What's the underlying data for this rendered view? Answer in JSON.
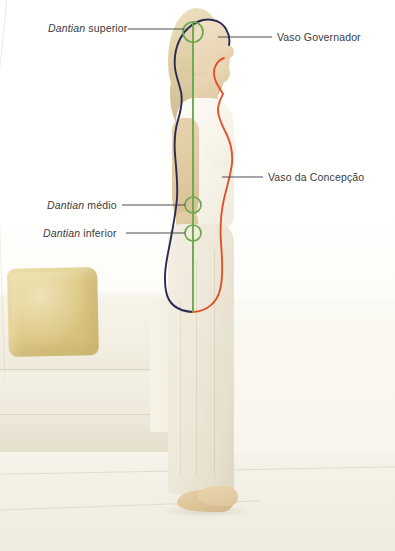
{
  "labels": {
    "dantian_superior": {
      "italic": "Dantian",
      "rest": "superior"
    },
    "dantian_medio": {
      "italic": "Dantian",
      "rest": "médio"
    },
    "dantian_inferior": {
      "italic": "Dantian",
      "rest": "inferior"
    },
    "vaso_governador": {
      "italic": "",
      "rest": "Vaso Governador"
    },
    "vaso_concepcao": {
      "italic": "",
      "rest": "Vaso da Concepção"
    }
  },
  "colors": {
    "governador": "#2b2a55",
    "concepcao": "#e2512a",
    "axis": "#6aa84f",
    "dantian_circle": "#6aa84f",
    "leader_line": "#3b3b42",
    "label_text": "#3b3b42",
    "cushion": "#ddc885",
    "background": "#fdfcf8"
  },
  "markers": {
    "dantian_points": [
      {
        "name": "dantian-superior",
        "cx": 193,
        "cy": 32,
        "r": 10
      },
      {
        "name": "dantian-medio",
        "cx": 193,
        "cy": 205,
        "r": 8
      },
      {
        "name": "dantian-inferior",
        "cx": 193,
        "cy": 233,
        "r": 8
      }
    ],
    "central_axis": {
      "x": 193,
      "y_top": 22,
      "y_bottom": 312
    }
  },
  "leaders": [
    {
      "name": "leader-dantian-superior",
      "x1": 128,
      "y1": 29,
      "x2": 184,
      "y2": 29
    },
    {
      "name": "leader-dantian-medio",
      "x1": 122,
      "y1": 205,
      "x2": 185,
      "y2": 205
    },
    {
      "name": "leader-dantian-inferior",
      "x1": 126,
      "y1": 233,
      "x2": 185,
      "y2": 233
    },
    {
      "name": "leader-vaso-governador",
      "x1": 218,
      "y1": 37,
      "x2": 272,
      "y2": 37
    },
    {
      "name": "leader-vaso-concepcao",
      "x1": 222,
      "y1": 177,
      "x2": 263,
      "y2": 177
    }
  ]
}
